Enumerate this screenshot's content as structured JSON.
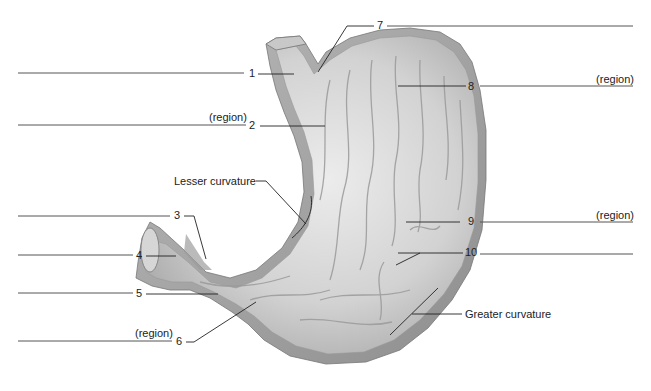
{
  "diagram": {
    "labels": [
      {
        "id": "1",
        "number": "1",
        "qualifier": "",
        "side": "left"
      },
      {
        "id": "2",
        "number": "2",
        "qualifier": "(region)",
        "side": "left"
      },
      {
        "id": "3",
        "number": "3",
        "qualifier": "",
        "side": "left"
      },
      {
        "id": "4",
        "number": "4",
        "qualifier": "",
        "side": "left"
      },
      {
        "id": "5",
        "number": "5",
        "qualifier": "",
        "side": "left"
      },
      {
        "id": "6",
        "number": "6",
        "qualifier": "(region)",
        "side": "left"
      },
      {
        "id": "7",
        "number": "7",
        "qualifier": "",
        "side": "right"
      },
      {
        "id": "8",
        "number": "8",
        "qualifier": "(region)",
        "side": "right"
      },
      {
        "id": "9",
        "number": "9",
        "qualifier": "(region)",
        "side": "right"
      },
      {
        "id": "10",
        "number": "10",
        "qualifier": "",
        "side": "right"
      }
    ],
    "named_labels": {
      "lesser_curvature": "Lesser curvature",
      "greater_curvature": "Greater curvature"
    },
    "colors": {
      "tissue_light": "#e4e4e4",
      "tissue_mid": "#bdbdbd",
      "tissue_dark": "#8a8a8a",
      "wall": "#a8a8a8",
      "ink": "#222222"
    }
  }
}
